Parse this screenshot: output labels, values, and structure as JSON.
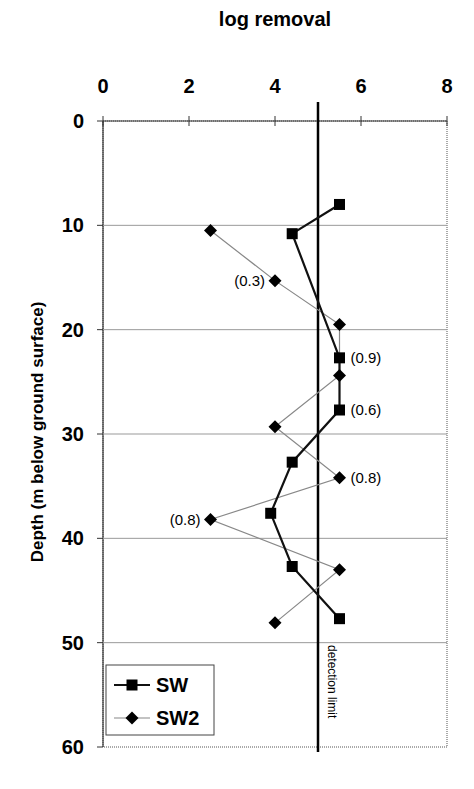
{
  "chart_data": {
    "type": "line",
    "title": "log removal",
    "xlabel": "log removal",
    "ylabel": "Depth (m below ground surface)",
    "xlim": [
      0,
      8
    ],
    "ylim": [
      0,
      60
    ],
    "y_inverted": true,
    "x_axis_position": "top",
    "x_ticks": [
      "0",
      "2",
      "4",
      "6",
      "8"
    ],
    "y_ticks": [
      "0",
      "10",
      "20",
      "30",
      "40",
      "50",
      "60"
    ],
    "grid": "horizontal",
    "legend_position": "lower left",
    "series": [
      {
        "name": "SW",
        "marker": "square",
        "line": "thick black",
        "points": [
          {
            "x": 5.5,
            "y": 8.0
          },
          {
            "x": 4.4,
            "y": 10.8
          },
          {
            "x": 5.5,
            "y": 22.7
          },
          {
            "x": 5.5,
            "y": 27.7
          },
          {
            "x": 4.4,
            "y": 32.7
          },
          {
            "x": 3.9,
            "y": 37.6
          },
          {
            "x": 4.4,
            "y": 42.7
          },
          {
            "x": 5.5,
            "y": 47.7
          }
        ]
      },
      {
        "name": "SW2",
        "marker": "diamond",
        "line": "thin gray",
        "points": [
          {
            "x": 2.5,
            "y": 10.5
          },
          {
            "x": 4.0,
            "y": 15.3
          },
          {
            "x": 5.5,
            "y": 19.5
          },
          {
            "x": 5.5,
            "y": 24.4
          },
          {
            "x": 4.0,
            "y": 29.3
          },
          {
            "x": 5.5,
            "y": 34.2
          },
          {
            "x": 2.5,
            "y": 38.2
          },
          {
            "x": 5.5,
            "y": 43.0
          },
          {
            "x": 4.0,
            "y": 48.1
          }
        ]
      }
    ],
    "reference_lines": [
      {
        "type": "vertical",
        "x": 5.0,
        "label": "detection limit"
      }
    ],
    "annotations": [
      {
        "text": "(0.3)",
        "x": 4.0,
        "y": 15.3,
        "side": "left"
      },
      {
        "text": "(0.9)",
        "x": 5.5,
        "y": 22.7,
        "side": "right"
      },
      {
        "text": "(0.6)",
        "x": 5.5,
        "y": 27.7,
        "side": "right"
      },
      {
        "text": "(0.8)",
        "x": 5.5,
        "y": 34.2,
        "side": "right"
      },
      {
        "text": "(0.8)",
        "x": 2.5,
        "y": 38.2,
        "side": "left"
      }
    ]
  },
  "legend": {
    "items": [
      {
        "label": "SW"
      },
      {
        "label": "SW2"
      }
    ]
  },
  "labels": {
    "title": "log removal",
    "ylabel": "Depth (m below ground surface)",
    "detection_limit": "detection limit"
  }
}
